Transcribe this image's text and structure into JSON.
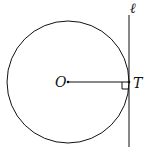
{
  "diagram": {
    "labels": {
      "center": "O",
      "tangent_point": "T",
      "line": "ℓ"
    },
    "stroke_color": "#111111"
  }
}
